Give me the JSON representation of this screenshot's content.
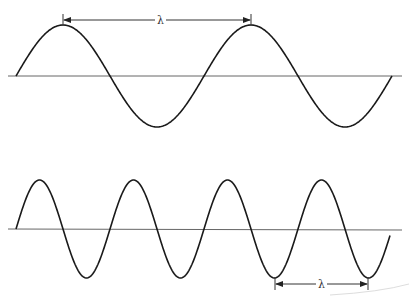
{
  "diagram": {
    "waves": [
      {
        "name": "long-wave",
        "label": "λ",
        "axis_y": 76,
        "x_start": 16,
        "x_end": 392,
        "amplitude": 51,
        "period": 188,
        "phase_start": 16,
        "arrow": {
          "x1": 63,
          "x2": 251,
          "y": 20
        }
      },
      {
        "name": "short-wave",
        "label": "λ",
        "axis_y": 229,
        "x_start": 16,
        "x_end": 390,
        "amplitude": 49,
        "period": 94,
        "phase_start": 16,
        "arrow": {
          "x1": 275,
          "x2": 368,
          "y": 284
        }
      }
    ],
    "colors": {
      "wave": "#1a1a1a",
      "axis": "#666666",
      "arrow": "#333333"
    }
  }
}
